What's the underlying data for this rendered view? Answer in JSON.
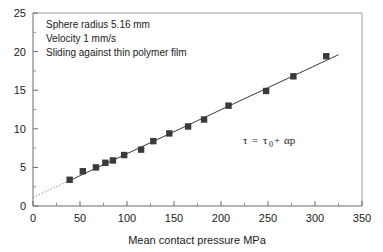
{
  "chart_data": {
    "type": "scatter",
    "title": "",
    "xlabel": "Mean contact pressure MPa",
    "ylabel": "",
    "xlim": [
      0,
      350
    ],
    "ylim": [
      0,
      25
    ],
    "xticks": [
      0,
      50,
      100,
      150,
      200,
      250,
      300,
      350
    ],
    "yticks": [
      0,
      5,
      10,
      15,
      20,
      25
    ],
    "xtick_labels": [
      "0",
      "50",
      "100",
      "150",
      "200",
      "250",
      "300",
      "350"
    ],
    "ytick_labels": [
      "0",
      "5",
      "10",
      "15",
      "20",
      "25"
    ],
    "x_minor_step": 25,
    "y_minor_step": 2.5,
    "grid": false,
    "legend": false,
    "marker": "filled-square",
    "marker_color": "#3a3a3a",
    "line_color": "#3a3a3a",
    "series": [
      {
        "name": "Shear stress vs mean contact pressure",
        "x": [
          39,
          53,
          67,
          77,
          85,
          97,
          115,
          128,
          145,
          165,
          182,
          208,
          248,
          277,
          312
        ],
        "y": [
          3.4,
          4.5,
          5.0,
          5.6,
          5.9,
          6.6,
          7.3,
          8.4,
          9.4,
          10.3,
          11.2,
          13.0,
          14.9,
          16.8,
          19.4
        ]
      }
    ],
    "fit_line": {
      "style": "solid",
      "x": [
        39,
        325
      ],
      "y": [
        3.3,
        19.6
      ]
    },
    "extrapolation_line": {
      "style": "dotted",
      "x": [
        0,
        39
      ],
      "y": [
        1.1,
        3.3
      ]
    },
    "annotations": [
      {
        "name": "conditions-note",
        "lines": [
          "Sphere radius 5.16 mm",
          "Velocity 1 mm/s",
          "Sliding against thin polymer film"
        ]
      },
      {
        "name": "equation",
        "text": "τ = τ₀ + αp",
        "parts": {
          "lhs": "τ",
          "equals": "=",
          "tau_base": "τ",
          "tau_sub": "0",
          "plus": "+",
          "alpha_p": "αp"
        }
      }
    ]
  },
  "axes": {
    "x_axis_label": "Mean contact pressure MPa"
  }
}
